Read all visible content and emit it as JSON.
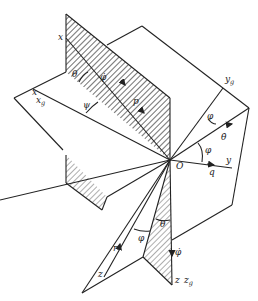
{
  "diagram": {
    "origin_label": "O",
    "axes": {
      "x": "x",
      "x_g": "x",
      "x_g_sub": "g",
      "y": "y",
      "y_g": "y",
      "y_g_sub": "g",
      "z": "z",
      "z_g": "z",
      "z_g_sub": "g"
    },
    "rates": {
      "p": "p",
      "q": "q",
      "r": "r",
      "theta_dot": "θ̇",
      "phi_dot_top": "φ̇",
      "phi_dot_bottom": "φ̇"
    },
    "angles": {
      "theta_top": "θ",
      "psi_left": "ψ",
      "phi_right_top": "φ",
      "phi_right": "φ",
      "theta_bottom": "θ",
      "phi_bottom": "φ"
    },
    "colors": {
      "line": "#222222",
      "hatch": "#333333",
      "background": "#ffffff"
    }
  }
}
